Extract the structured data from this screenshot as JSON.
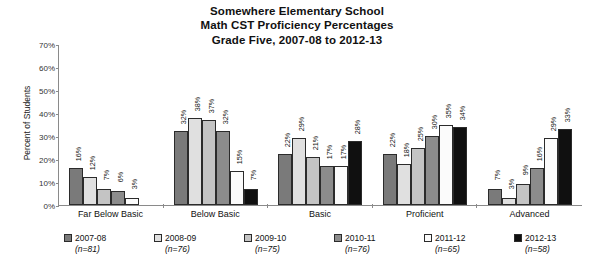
{
  "chart_data": {
    "type": "bar",
    "title": "Somewhere Elementary School\nMath CST Proficiency Percentages\nGrade Five, 2007-08 to 2012-13",
    "title_lines": [
      "Somewhere Elementary School",
      "Math CST Proficiency Percentages",
      "Grade Five, 2007-08 to 2012-13"
    ],
    "xlabel": "",
    "ylabel": "Percent of Students",
    "ylim": [
      0,
      70
    ],
    "ytick_labels": [
      "70%",
      "60%",
      "50%",
      "40%",
      "30%",
      "20%",
      "10%",
      "0%"
    ],
    "ytick_values": [
      70,
      60,
      50,
      40,
      30,
      20,
      10,
      0
    ],
    "grid": false,
    "legend_position": "bottom",
    "categories": [
      "Far Below Basic",
      "Below Basic",
      "Basic",
      "Proficient",
      "Advanced"
    ],
    "series": [
      {
        "name": "2007-08",
        "n_label": "(n=81)",
        "n": 81,
        "color": "#7a7a7a",
        "values": [
          16,
          32,
          22,
          22,
          7
        ],
        "value_labels": [
          "16%",
          "32%",
          "22%",
          "22%",
          "7%"
        ]
      },
      {
        "name": "2008-09",
        "n_label": "(n=76)",
        "n": 76,
        "color": "#e0e0e0",
        "values": [
          12,
          38,
          29,
          18,
          3
        ],
        "value_labels": [
          "12%",
          "38%",
          "29%",
          "18%",
          "3%"
        ]
      },
      {
        "name": "2009-10",
        "n_label": "(n=75)",
        "n": 75,
        "color": "#c4c4c4",
        "values": [
          7,
          37,
          21,
          25,
          9
        ],
        "value_labels": [
          "7%",
          "37%",
          "21%",
          "25%",
          "9%"
        ]
      },
      {
        "name": "2010-11",
        "n_label": "(n=76)",
        "n": 76,
        "color": "#8c8c8c",
        "values": [
          6,
          32,
          17,
          30,
          16
        ],
        "value_labels": [
          "6%",
          "32%",
          "17%",
          "30%",
          "16%"
        ]
      },
      {
        "name": "2011-12",
        "n_label": "(n=65)",
        "n": 65,
        "color": "#fbfbfb",
        "values": [
          3,
          15,
          17,
          35,
          29
        ],
        "value_labels": [
          "3%",
          "15%",
          "17%",
          "35%",
          "29%"
        ]
      },
      {
        "name": "2012-13",
        "n_label": "(n=58)",
        "n": 58,
        "color": "#101010",
        "values": [
          0,
          7,
          28,
          34,
          33
        ],
        "value_labels": [
          "",
          "7%",
          "28%",
          "34%",
          "33%"
        ]
      }
    ]
  }
}
